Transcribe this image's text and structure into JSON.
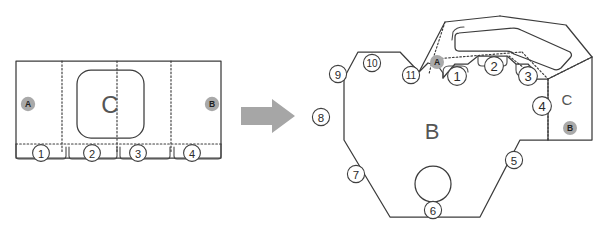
{
  "figure": {
    "background_color": "#ffffff",
    "line_color": "#3c3c3c",
    "fold_line_style": "dotted",
    "marker_fill_color": "#a9a9a9",
    "arrow_color": "#a6a6a6",
    "region_label_color": "#555555"
  },
  "arrow": {
    "name": "transformation-arrow",
    "direction": "right",
    "label": ""
  },
  "left_panel": {
    "name": "flat-blank-panel",
    "region_label": "C",
    "markers": [
      {
        "id": "A",
        "label": "A",
        "x": 28,
        "y": 104
      },
      {
        "id": "B",
        "label": "B",
        "x": 212,
        "y": 104
      }
    ],
    "fold_lines_vertical": [
      {
        "x": 62,
        "label": "fold-line-left"
      },
      {
        "x": 117,
        "label": "fold-line-center"
      },
      {
        "x": 171,
        "label": "fold-line-right"
      }
    ],
    "fold_line_horizontal": {
      "y": 144,
      "label": "fold-line-bottom"
    },
    "callouts": [
      {
        "label": "1",
        "x": 41,
        "y": 153
      },
      {
        "label": "2",
        "x": 92,
        "y": 153
      },
      {
        "label": "3",
        "x": 138,
        "y": 153
      },
      {
        "label": "4",
        "x": 192,
        "y": 153
      }
    ],
    "window": {
      "name": "rounded-window-C",
      "x": 77,
      "y": 70,
      "width": 67,
      "height": 68,
      "radius": 14
    }
  },
  "right_panel": {
    "name": "folded-assembly",
    "region_labels": [
      {
        "label": "B",
        "x": 432,
        "y": 131,
        "size": 22
      },
      {
        "label": "C",
        "x": 567,
        "y": 99,
        "size": 15
      }
    ],
    "markers": [
      {
        "id": "A",
        "label": "A",
        "x": 437,
        "y": 62
      },
      {
        "id": "B",
        "label": "B",
        "x": 570,
        "y": 128
      }
    ],
    "hole": {
      "name": "circular-hole",
      "cx": 433,
      "cy": 184,
      "r": 18
    },
    "callouts": [
      {
        "label": "1",
        "x": 457,
        "y": 76
      },
      {
        "label": "2",
        "x": 494,
        "y": 66
      },
      {
        "label": "3",
        "x": 528,
        "y": 76
      },
      {
        "label": "4",
        "x": 542,
        "y": 106
      },
      {
        "label": "5",
        "x": 514,
        "y": 160
      },
      {
        "label": "6",
        "x": 433,
        "y": 210
      },
      {
        "label": "7",
        "x": 356,
        "y": 174
      },
      {
        "label": "8",
        "x": 321,
        "y": 117
      },
      {
        "label": "9",
        "x": 338,
        "y": 74
      },
      {
        "label": "10",
        "x": 372,
        "y": 63
      },
      {
        "label": "11",
        "x": 411,
        "y": 75
      }
    ]
  }
}
